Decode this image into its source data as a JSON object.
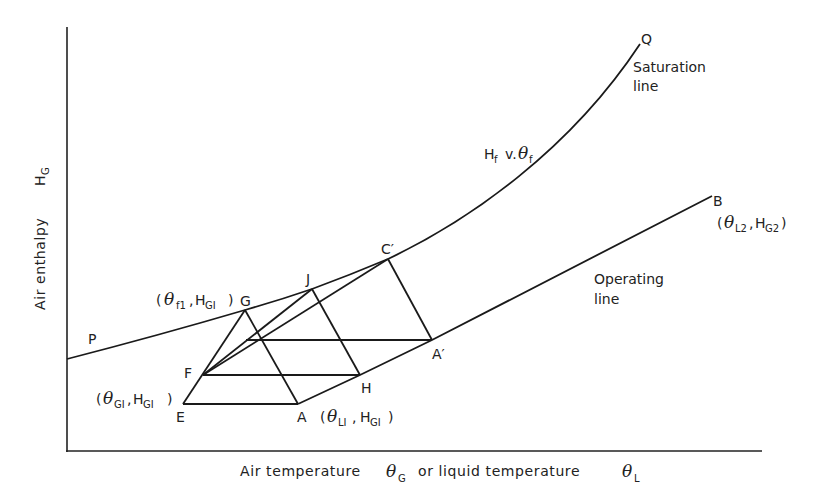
{
  "diagram": {
    "axes": {
      "x_label_prefix": "Air temperature",
      "x_sym1": "θ",
      "x_sym1_sub": "G",
      "x_label_mid": "or liquid temperature",
      "x_sym2": "θ",
      "x_sym2_sub": "L",
      "y_label": "Air enthalpy",
      "y_sym": "H",
      "y_sym_sub": "G"
    },
    "curves": {
      "saturation": {
        "start_label": "P",
        "end_label": "Q",
        "name_line1": "Saturation",
        "name_line2": "line",
        "eq_h": "H",
        "eq_h_sub": "f",
        "eq_v": "v.",
        "eq_theta": "θ",
        "eq_theta_sub": "f"
      },
      "operating": {
        "end_label": "B",
        "name_line1": "Operating",
        "name_line2": "line",
        "end_coord_open": "(",
        "end_theta": "θ",
        "end_theta_sub": "L2",
        "end_sep": ",",
        "end_h": "H",
        "end_h_sub": "G2",
        "end_coord_close": ")"
      }
    },
    "points": {
      "A": "A",
      "A_prime": "A′",
      "C_prime": "C′",
      "E": "E",
      "F": "F",
      "G": "G",
      "H": "H",
      "J": "J"
    },
    "coords": {
      "G": {
        "open": "(",
        "theta": "θ",
        "theta_sub": "f1",
        "sep": ",",
        "h": "H",
        "h_sub": "GI",
        "close": ")"
      },
      "E": {
        "open": "(",
        "theta": "θ",
        "theta_sub": "GI",
        "sep": ",",
        "h": "H",
        "h_sub": "GI",
        "close": ")"
      },
      "A": {
        "open": "(",
        "theta": "θ",
        "theta_sub": "LI",
        "sep": ",",
        "h": "H",
        "h_sub": "GI",
        "close": ")"
      }
    }
  }
}
